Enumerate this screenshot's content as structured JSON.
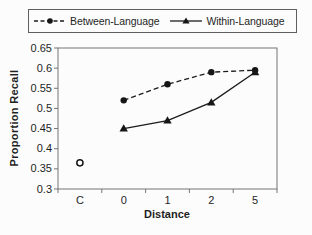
{
  "chart_data": {
    "type": "line",
    "categories": [
      "C",
      "0",
      "1",
      "2",
      "5"
    ],
    "series": [
      {
        "id": "between-language",
        "name": "Between-Language",
        "values": [
          null,
          0.52,
          0.56,
          0.59,
          0.595
        ],
        "line_style": "dashed",
        "marker": "circle",
        "in_legend": true
      },
      {
        "id": "within-language",
        "name": "Within-Language",
        "values": [
          null,
          0.45,
          0.47,
          0.515,
          0.59
        ],
        "line_style": "solid",
        "marker": "triangle",
        "in_legend": true
      },
      {
        "id": "control-point",
        "name": "",
        "values": [
          0.365,
          null,
          null,
          null,
          null
        ],
        "line_style": "none",
        "marker": "open-circle",
        "in_legend": false
      }
    ],
    "xlabel": "Distance",
    "ylabel": "Proportion Recall",
    "ylim": [
      0.3,
      0.65
    ],
    "ytick_values": [
      0.65,
      0.6,
      0.55,
      0.5,
      0.45,
      0.4,
      0.35,
      0.3
    ],
    "ytick_labels": [
      "0.65",
      "0.6",
      "0.55",
      "0.5",
      "0.45",
      "0.4",
      "0.35",
      "0.3"
    ],
    "grid": false,
    "legend_position": "top",
    "colors": {
      "line": "#1c1c1c",
      "marker": "#161616",
      "axis": "#757575",
      "tick_text": "#1f1f1f",
      "legend_border": "#5f5f5f",
      "background": "#fcfcfc"
    }
  }
}
